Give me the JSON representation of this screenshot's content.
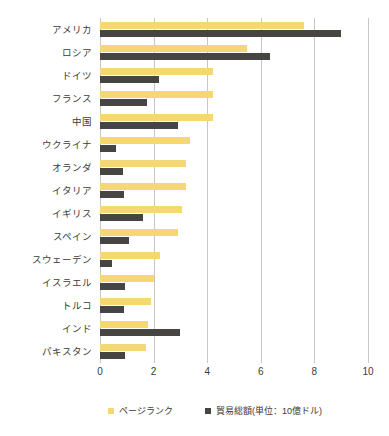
{
  "chart_data": {
    "type": "bar",
    "orientation": "horizontal",
    "title": "",
    "subtitle": "",
    "xlabel": "",
    "ylabel": "",
    "xlim": [
      0,
      10
    ],
    "xticks": [
      "0",
      "2",
      "4",
      "6",
      "8",
      "10"
    ],
    "xtick_values": [
      0,
      2,
      4,
      6,
      8,
      10
    ],
    "grid": true,
    "legend_position": "bottom",
    "categories": [
      "アメリカ",
      "ロシア",
      "ドイツ",
      "フランス",
      "中国",
      "ウクライナ",
      "オランダ",
      "イタリア",
      "イギリス",
      "スペイン",
      "スウェーデン",
      "イスラエル",
      "トルコ",
      "インド",
      "パキスタン"
    ],
    "series": [
      {
        "name": "ページランク",
        "color": "#f5d873",
        "values": [
          7.6,
          5.5,
          4.2,
          4.2,
          4.2,
          3.35,
          3.2,
          3.2,
          3.05,
          2.9,
          2.25,
          2.0,
          1.9,
          1.8,
          1.7
        ]
      },
      {
        "name": "貿易総額(単位：10億ドル)",
        "color": "#474542",
        "values": [
          9.0,
          6.35,
          2.2,
          1.75,
          2.9,
          0.6,
          0.85,
          0.9,
          1.6,
          1.1,
          0.45,
          0.95,
          0.9,
          3.0,
          0.95
        ]
      }
    ],
    "legend": [
      {
        "label": "ページランク",
        "color": "#f5d873"
      },
      {
        "label": "貿易総額(単位：10億ドル)",
        "color": "#474542"
      }
    ]
  },
  "colors": {
    "pagerank": "#f5d873",
    "trade": "#474542",
    "grid": "#c9c7c4",
    "text": "#3d3b38",
    "background": "#ffffff"
  }
}
